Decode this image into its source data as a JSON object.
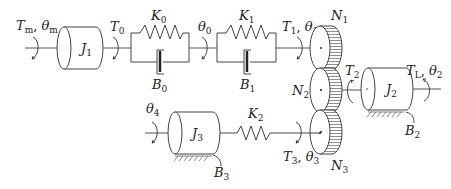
{
  "diagram": {
    "type": "mechanical-rotational-system",
    "labels": {
      "Tm_theta_m": {
        "main": "T",
        "sub": "m",
        "main2": "θ",
        "sub2": "m"
      },
      "J1": {
        "main": "J",
        "sub": "1"
      },
      "T0": {
        "main": "T",
        "sub": "0"
      },
      "K0": {
        "main": "K",
        "sub": "0"
      },
      "B0": {
        "main": "B",
        "sub": "0"
      },
      "theta0": {
        "main": "θ",
        "sub": "0"
      },
      "K1": {
        "main": "K",
        "sub": "1"
      },
      "B1": {
        "main": "B",
        "sub": "1"
      },
      "T1_theta1": {
        "main": "T",
        "sub": "1",
        "main2": "θ",
        "sub2": "1"
      },
      "N1": {
        "main": "N",
        "sub": "1"
      },
      "N2": {
        "main": "N",
        "sub": "2"
      },
      "N3": {
        "main": "N",
        "sub": "3"
      },
      "T2": {
        "main": "T",
        "sub": "2"
      },
      "J2": {
        "main": "J",
        "sub": "2"
      },
      "TL_theta2": {
        "main": "T",
        "sub": "L",
        "main2": "θ",
        "sub2": "2"
      },
      "B2": {
        "main": "B",
        "sub": "2"
      },
      "theta4": {
        "main": "θ",
        "sub": "4"
      },
      "J3": {
        "main": "J",
        "sub": "3"
      },
      "K2": {
        "main": "K",
        "sub": "2"
      },
      "T3_theta3": {
        "main": "T",
        "sub": "3",
        "main2": "θ",
        "sub2": "3"
      },
      "B3": {
        "main": "B",
        "sub": "3"
      }
    },
    "separator": ", "
  }
}
